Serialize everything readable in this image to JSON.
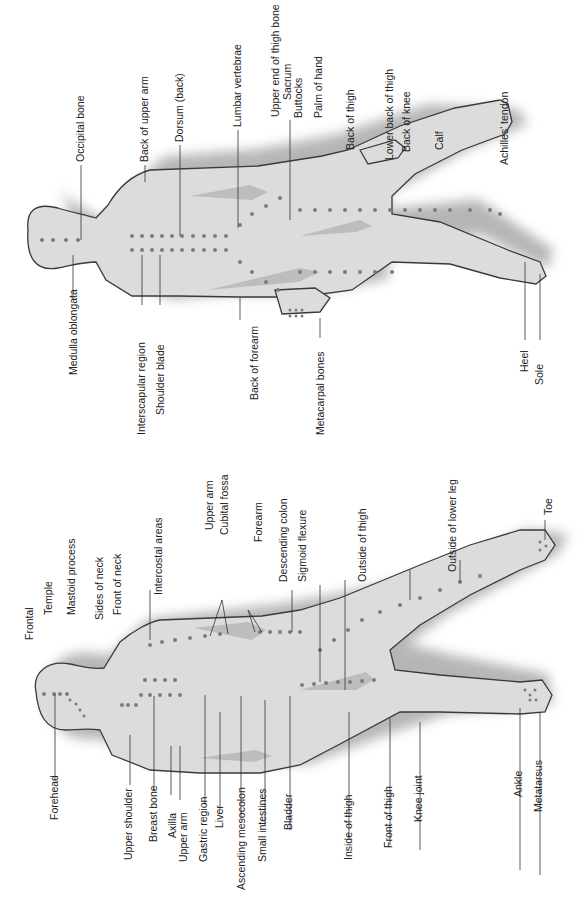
{
  "diagram": {
    "orientation": "rotated 90° counter-clockwise (read bottom-to-top)",
    "figures": [
      {
        "id": "back-view",
        "view": "posterior",
        "labels": [
          "Occipital bone",
          "Back of upper arm",
          "Dorsum (back)",
          "Lumbar vertebrae",
          "Upper end of thigh bone",
          "Sacrum",
          "Buttocks",
          "Palm of hand",
          "Back of thigh",
          "Lower back of thigh",
          "Back of knee",
          "Calf",
          "Achilles' tendon",
          "Medulla oblongata",
          "Interscapular region",
          "Shoulder blade",
          "Back of forearm",
          "Metacarpal bones",
          "Heel",
          "Sole"
        ]
      },
      {
        "id": "front-view",
        "view": "anterior",
        "labels": [
          "Frontal",
          "Temple",
          "Mastoid process",
          "Sides of neck",
          "Front of neck",
          "Intercostal areas",
          "Upper arm",
          "Cubital fossa",
          "Forearm",
          "Descending colon",
          "Sigmoid flexure",
          "Outside of thigh",
          "Outside of lower leg",
          "Toe",
          "Forehead",
          "Upper shoulder",
          "Breast bone",
          "Axilla",
          "Upper arm",
          "Gastric region",
          "Liver",
          "Ascending mesocolon",
          "Small intestines",
          "Bladder",
          "Inside of thigh",
          "Front of thigh",
          "Knee joint",
          "Ankle",
          "Metatarsus"
        ]
      }
    ],
    "colors": {
      "body_fill": "#dcdcdc",
      "outline": "#3a3a3a",
      "points": "#7c7c7c",
      "text": "#222222"
    }
  }
}
